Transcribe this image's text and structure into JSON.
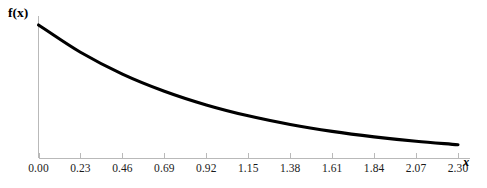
{
  "chart_data": {
    "type": "line",
    "title": "",
    "subtitle": "",
    "xlabel": "x",
    "ylabel": "f(x)",
    "xlim": [
      0.0,
      2.3
    ],
    "ylim": [
      0.0,
      1.0
    ],
    "grid": false,
    "legend": null,
    "legend_position": "none",
    "curve_color": "#000000",
    "axis_color": "#b9b9b9",
    "background_color": "#ffffff",
    "annotations": [],
    "xticks": [
      0.0,
      0.23,
      0.46,
      0.69,
      0.92,
      1.15,
      1.38,
      1.61,
      1.84,
      2.07,
      2.3
    ],
    "xtick_labels": [
      "0.00",
      "0.23",
      "0.46",
      "0.69",
      "0.92",
      "1.15",
      "1.38",
      "1.61",
      "1.84",
      "2.07",
      "2.30"
    ],
    "yticks": [],
    "ytick_labels": [],
    "series": [
      {
        "name": "f(x)",
        "x": [
          0.0,
          0.23,
          0.46,
          0.69,
          0.92,
          1.15,
          1.38,
          1.61,
          1.84,
          2.07,
          2.3
        ],
        "values": [
          1.0,
          0.795,
          0.631,
          0.502,
          0.399,
          0.317,
          0.252,
          0.2,
          0.159,
          0.126,
          0.1
        ]
      }
    ]
  },
  "axes": {
    "ylabel_text": "f(x)",
    "xlabel_text": "x"
  }
}
